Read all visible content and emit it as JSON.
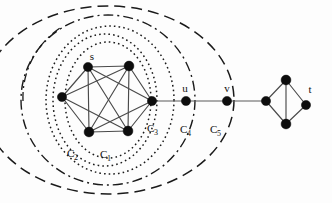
{
  "figure": {
    "background": "#fdfdfd",
    "width": 332,
    "height": 203,
    "ink_color": "#0d0d0d",
    "edge_color": "#4a4a4a"
  },
  "vertex_labels": {
    "s": "s",
    "u": "u",
    "v": "v",
    "t": "t"
  },
  "cluster_labels": {
    "c1_base": "C",
    "c1_sub": "1",
    "c2_base": "C",
    "c2_sub": "2",
    "c3_base": "C",
    "c3_sub": "3",
    "c4_base": "C",
    "c4_sub": "4",
    "c5_base": "C",
    "c5_sub": "5"
  },
  "graph_data": {
    "type": "node-link-diagram",
    "nodes": [
      {
        "id": "n1",
        "label": "s",
        "cx": 88,
        "cy": 67,
        "r": 4.6
      },
      {
        "id": "n2",
        "label": "",
        "cx": 129,
        "cy": 66,
        "r": 4.8
      },
      {
        "id": "n3",
        "label": "",
        "cx": 62,
        "cy": 97,
        "r": 4.6
      },
      {
        "id": "n4",
        "label": "",
        "cx": 152,
        "cy": 101,
        "r": 4.6
      },
      {
        "id": "n5",
        "label": "",
        "cx": 89,
        "cy": 132,
        "r": 4.8
      },
      {
        "id": "n6",
        "label": "",
        "cx": 128,
        "cy": 131,
        "r": 4.8
      },
      {
        "id": "n7",
        "label": "u",
        "cx": 186,
        "cy": 101,
        "r": 4.6
      },
      {
        "id": "n8",
        "label": "v",
        "cx": 227,
        "cy": 101,
        "r": 4.6
      },
      {
        "id": "n9",
        "label": "",
        "cx": 266,
        "cy": 101,
        "r": 4.6
      },
      {
        "id": "n10",
        "label": "",
        "cx": 286,
        "cy": 80,
        "r": 4.8
      },
      {
        "id": "n11",
        "label": "",
        "cx": 286,
        "cy": 124,
        "r": 4.8
      },
      {
        "id": "n12",
        "label": "t",
        "cx": 306,
        "cy": 105,
        "r": 4.6
      }
    ],
    "edges": [
      [
        "n1",
        "n2"
      ],
      [
        "n1",
        "n3"
      ],
      [
        "n1",
        "n5"
      ],
      [
        "n1",
        "n6"
      ],
      [
        "n1",
        "n4"
      ],
      [
        "n2",
        "n3"
      ],
      [
        "n2",
        "n5"
      ],
      [
        "n2",
        "n6"
      ],
      [
        "n2",
        "n4"
      ],
      [
        "n3",
        "n5"
      ],
      [
        "n3",
        "n6"
      ],
      [
        "n5",
        "n6"
      ],
      [
        "n5",
        "n4"
      ],
      [
        "n6",
        "n4"
      ],
      [
        "n4",
        "n7"
      ],
      [
        "n7",
        "n8"
      ],
      [
        "n8",
        "n9"
      ],
      [
        "n9",
        "n10"
      ],
      [
        "n9",
        "n11"
      ],
      [
        "n10",
        "n11"
      ],
      [
        "n10",
        "n12"
      ],
      [
        "n11",
        "n12"
      ]
    ]
  },
  "clusters": [
    {
      "name": "C1",
      "style": "dotted",
      "cx": 108,
      "cy": 100,
      "rx": 43,
      "ry": 58,
      "label_x": 104,
      "label_y": 158
    },
    {
      "name": "C2",
      "style": "dotted",
      "cx": 105,
      "cy": 100,
      "rx": 52,
      "ry": 66,
      "label_x": 71,
      "label_y": 158
    },
    {
      "name": "C3",
      "style": "dotted",
      "cx": 110,
      "cy": 100,
      "rx": 64,
      "ry": 74,
      "label_x": 151,
      "label_y": 132
    },
    {
      "name": "C4",
      "style": "dash-dot",
      "cx": 108,
      "cy": 100,
      "rx": 87,
      "ry": 85,
      "label_x": 184,
      "label_y": 133
    },
    {
      "name": "C5",
      "style": "long-dash",
      "cx": 108,
      "cy": 100,
      "rx": 126,
      "ry": 94,
      "label_x": 214,
      "label_y": 133
    }
  ]
}
